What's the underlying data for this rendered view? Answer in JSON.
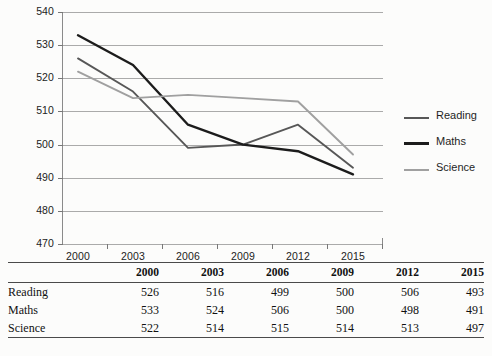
{
  "chart_data": {
    "type": "line",
    "title": "",
    "xlabel": "",
    "ylabel": "",
    "categories": [
      "2000",
      "2003",
      "2006",
      "2009",
      "2012",
      "2015"
    ],
    "ylim": [
      470,
      540
    ],
    "yticks": [
      470,
      480,
      490,
      500,
      510,
      520,
      530,
      540
    ],
    "grid": true,
    "legend_position": "right",
    "series": [
      {
        "name": "Reading",
        "values": [
          526,
          516,
          499,
          500,
          506,
          493
        ],
        "color": "#575757"
      },
      {
        "name": "Maths",
        "values": [
          533,
          524,
          506,
          500,
          498,
          491
        ],
        "color": "#1c1c1c"
      },
      {
        "name": "Science",
        "values": [
          522,
          514,
          515,
          514,
          513,
          497
        ],
        "color": "#a0a0a0"
      }
    ]
  },
  "axes": {
    "y_tick_labels": [
      "540",
      "530",
      "520",
      "510",
      "500",
      "490",
      "480",
      "470"
    ],
    "x_tick_labels": [
      "2000",
      "2003",
      "2006",
      "2009",
      "2012",
      "2015"
    ]
  },
  "legend": {
    "items": [
      {
        "label": "Reading"
      },
      {
        "label": "Maths"
      },
      {
        "label": "Science"
      }
    ]
  },
  "table": {
    "corner_label": "",
    "columns": [
      "2000",
      "2003",
      "2006",
      "2009",
      "2012",
      "2015"
    ],
    "rows": [
      {
        "label": "Reading",
        "values": [
          "526",
          "516",
          "499",
          "500",
          "506",
          "493"
        ]
      },
      {
        "label": "Maths",
        "values": [
          "533",
          "524",
          "506",
          "500",
          "498",
          "491"
        ]
      },
      {
        "label": "Science",
        "values": [
          "522",
          "514",
          "515",
          "514",
          "513",
          "497"
        ]
      }
    ]
  }
}
